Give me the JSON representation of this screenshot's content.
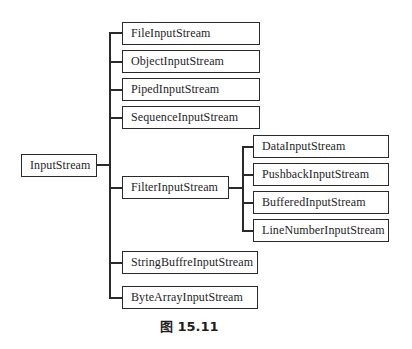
{
  "diagram": {
    "root": "InputStream",
    "children": [
      "FileInputStream",
      "ObjectInputStream",
      "PipedInputStream",
      "SequenceInputStream",
      "FilterInputStream",
      "StringBuffreInputStream",
      "ByteArrayInputStream"
    ],
    "filter_children": [
      "DataInputStream",
      "PushbackInputStream",
      "BufferedInputStream",
      "LineNumberInputStream"
    ],
    "caption": "图 15.11"
  }
}
